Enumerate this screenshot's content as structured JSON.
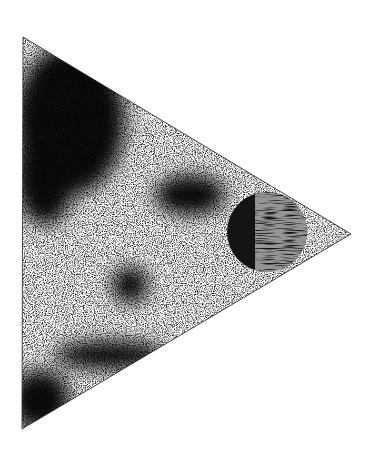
{
  "artwork": {
    "type": "print",
    "background": "#ffffff",
    "ink": "#111111",
    "triangle": {
      "points": [
        [
          23,
          37
        ],
        [
          351,
          234
        ],
        [
          22,
          429
        ]
      ]
    },
    "circle": {
      "cx": 267,
      "cy": 232,
      "r": 40,
      "fill": "#141414"
    },
    "dark_masses": [
      {
        "cx": 70,
        "cy": 120,
        "rx": 55,
        "ry": 75
      },
      {
        "cx": 45,
        "cy": 175,
        "rx": 30,
        "ry": 50
      },
      {
        "cx": 190,
        "cy": 195,
        "rx": 35,
        "ry": 20
      },
      {
        "cx": 130,
        "cy": 285,
        "rx": 18,
        "ry": 18
      },
      {
        "cx": 40,
        "cy": 400,
        "rx": 30,
        "ry": 30
      },
      {
        "cx": 110,
        "cy": 355,
        "rx": 55,
        "ry": 14
      }
    ]
  }
}
